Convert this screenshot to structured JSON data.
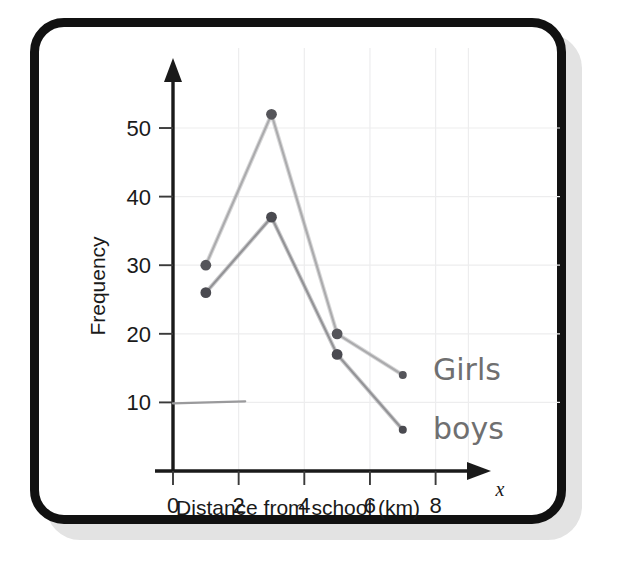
{
  "page": {
    "background_color": "#ffffff",
    "card": {
      "border_color": "#111111",
      "fill_color": "#ffffff",
      "shadow_color": "#e3e3e3"
    }
  },
  "chart_data": {
    "type": "line",
    "title": "",
    "subtitle": "",
    "xlabel": "Distance from school (km)",
    "ylabel": "Frequency",
    "x_axis_variable": "x",
    "xlim": [
      0,
      9.2
    ],
    "ylim": [
      0,
      57
    ],
    "xticks": [
      0,
      2,
      4,
      6,
      8
    ],
    "xtick_labels": [
      "0",
      "2",
      "4",
      "6",
      "8"
    ],
    "yticks": [
      10,
      20,
      30,
      40,
      50
    ],
    "ytick_labels": [
      "10",
      "20",
      "30",
      "40",
      "50"
    ],
    "grid": true,
    "grid_color": "#ededee",
    "legend": "annotated",
    "legend_position": "right-inline",
    "x": [
      1,
      3,
      5,
      7
    ],
    "series": [
      {
        "name": "Girls",
        "label": "Girls",
        "color": "#a9a9ab",
        "marker_color": "#55555a",
        "values": [
          30,
          52,
          20,
          14
        ]
      },
      {
        "name": "boys",
        "label": "boys",
        "color": "#8f8f92",
        "marker_color": "#4a4a50",
        "values": [
          26,
          37,
          17,
          6
        ]
      }
    ],
    "annotations": [
      {
        "name": "stray-pencil-line",
        "description": "short horizontal pencil mark at y=10",
        "x_start": 0,
        "x_end": 2.2,
        "y": 10
      }
    ]
  }
}
